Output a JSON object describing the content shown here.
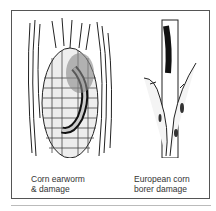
{
  "figures": [
    {
      "caption_line1": "Corn earworm",
      "caption_line2": "& damage"
    },
    {
      "caption_line1": "European corn",
      "caption_line2": "borer damage"
    }
  ]
}
